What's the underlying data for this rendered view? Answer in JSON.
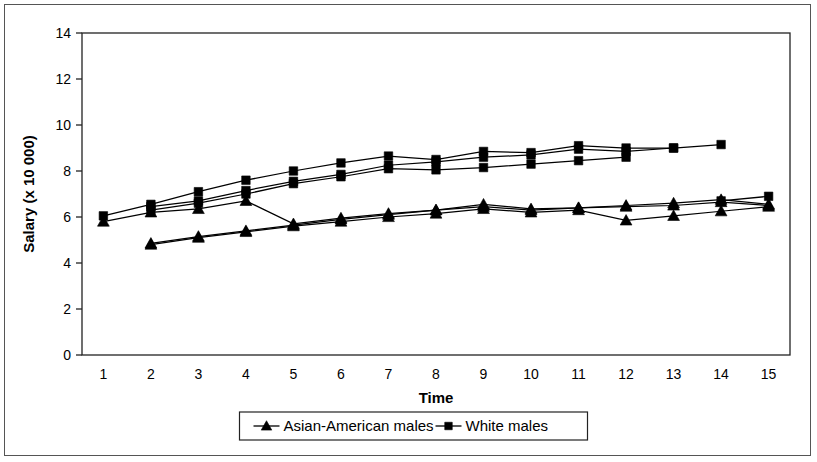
{
  "figure": {
    "background_color": "#ffffff",
    "border_color": "#555555",
    "line_color": "#000000",
    "axis_color": "#222222"
  },
  "chart_data": {
    "type": "line",
    "title": "",
    "subtitle": "",
    "xlabel": "Time",
    "ylabel": "Salary (x 10 000)",
    "xlim": [
      0.55,
      15.45
    ],
    "ylim": [
      0,
      14
    ],
    "xticks": [
      1,
      2,
      3,
      4,
      5,
      6,
      7,
      8,
      9,
      10,
      11,
      12,
      13,
      14,
      15
    ],
    "xticklabels": [
      "1",
      "2",
      "3",
      "4",
      "5",
      "6",
      "7",
      "8",
      "9",
      "10",
      "11",
      "12",
      "13",
      "14",
      "15"
    ],
    "yticks": [
      0,
      2,
      4,
      6,
      8,
      10,
      12,
      14
    ],
    "yticklabels": [
      "0",
      "2",
      "4",
      "6",
      "8",
      "10",
      "12",
      "14"
    ],
    "grid": false,
    "legend_position": "bottom-center",
    "legend_entries": [
      {
        "label": "Asian-American males",
        "marker": "triangle"
      },
      {
        "label": "White males",
        "marker": "square"
      }
    ],
    "series": [
      {
        "name": "White males cohort 1",
        "group": "White males",
        "marker": "square",
        "x": [
          1,
          2,
          3,
          4,
          5,
          6,
          7,
          8,
          9,
          10,
          11,
          12,
          13,
          14
        ],
        "y": [
          6.05,
          6.55,
          7.1,
          7.6,
          8.0,
          8.35,
          8.65,
          8.5,
          8.85,
          8.8,
          9.1,
          9.0,
          9.0,
          9.15
        ]
      },
      {
        "name": "White males cohort 2",
        "group": "White males",
        "marker": "square",
        "x": [
          2,
          3,
          4,
          5,
          6,
          7,
          8,
          9,
          10,
          11,
          12,
          13
        ],
        "y": [
          6.45,
          6.7,
          7.15,
          7.55,
          7.85,
          8.25,
          8.4,
          8.6,
          8.7,
          8.95,
          8.85,
          9.0
        ]
      },
      {
        "name": "White males cohort 3",
        "group": "White males",
        "marker": "square",
        "x": [
          2,
          3,
          4,
          5,
          6,
          7,
          8,
          9,
          10,
          11,
          12
        ],
        "y": [
          6.3,
          6.6,
          7.0,
          7.45,
          7.75,
          8.1,
          8.05,
          8.15,
          8.3,
          8.45,
          8.6
        ]
      },
      {
        "name": "White males late cohort",
        "group": "White males",
        "marker": "square",
        "x": [
          14,
          15
        ],
        "y": [
          6.7,
          6.9
        ]
      },
      {
        "name": "Asian-American males cohort 1",
        "group": "Asian-American males",
        "marker": "triangle",
        "x": [
          1,
          2,
          3,
          4,
          5,
          6,
          7,
          8,
          9,
          10,
          11,
          12,
          13,
          14,
          15
        ],
        "y": [
          5.8,
          6.2,
          6.35,
          6.7,
          5.7,
          5.95,
          6.15,
          6.3,
          6.55,
          6.35,
          6.4,
          6.5,
          6.6,
          6.75,
          6.55
        ]
      },
      {
        "name": "Asian-American males cohort 2",
        "group": "Asian-American males",
        "marker": "triangle",
        "x": [
          2,
          3,
          4,
          5,
          6,
          7,
          8,
          9,
          10,
          11,
          12,
          13,
          14,
          15
        ],
        "y": [
          4.85,
          5.15,
          5.4,
          5.65,
          5.9,
          6.1,
          6.3,
          6.45,
          6.3,
          6.4,
          6.45,
          6.5,
          6.65,
          6.5
        ]
      },
      {
        "name": "Asian-American males cohort 3",
        "group": "Asian-American males",
        "marker": "triangle",
        "x": [
          2,
          3,
          4,
          5,
          6,
          7,
          8,
          9,
          10,
          11,
          12,
          13,
          14,
          15
        ],
        "y": [
          4.8,
          5.1,
          5.35,
          5.6,
          5.8,
          6.0,
          6.15,
          6.35,
          6.2,
          6.3,
          5.85,
          6.05,
          6.25,
          6.45
        ]
      }
    ]
  }
}
